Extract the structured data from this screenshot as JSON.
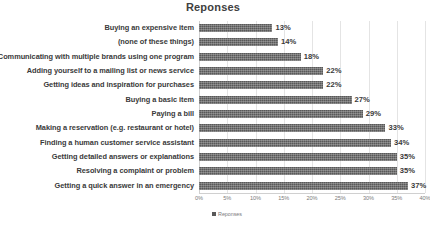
{
  "chart_data": {
    "type": "bar",
    "orientation": "horizontal",
    "title": "Reponses",
    "xlabel": "",
    "ylabel": "",
    "xlim": [
      0,
      40
    ],
    "xtick_labels": [
      "0%",
      "5%",
      "10%",
      "15%",
      "20%",
      "25%",
      "30%",
      "35%",
      "40%"
    ],
    "xtick_values": [
      0,
      5,
      10,
      15,
      20,
      25,
      30,
      35,
      40
    ],
    "grid": true,
    "legend_position": "bottom",
    "series": [
      {
        "name": "Reponses",
        "color": "#595959",
        "values": [
          13,
          14,
          18,
          22,
          22,
          27,
          29,
          33,
          34,
          35,
          35,
          37
        ]
      }
    ],
    "categories": [
      "Buying an expensive item",
      "(none of these things)",
      "Communicating with multiple brands using one program",
      "Adding yourself to a mailing list or news service",
      "Getting ideas and inspiration for purchases",
      "Buying a basic item",
      "Paying a bill",
      "Making a reservation (e.g. restaurant or hotel)",
      "Finding a human customer service assistant",
      "Getting detailed answers or explanations",
      "Resolving a complaint or problem",
      "Getting a quick answer in an emergency"
    ],
    "data_labels": [
      "13%",
      "14%",
      "18%",
      "22%",
      "22%",
      "27%",
      "29%",
      "33%",
      "34%",
      "35%",
      "35%",
      "37%"
    ]
  },
  "legend": {
    "entries": [
      {
        "label": "Reponses",
        "color": "#595959"
      }
    ]
  }
}
